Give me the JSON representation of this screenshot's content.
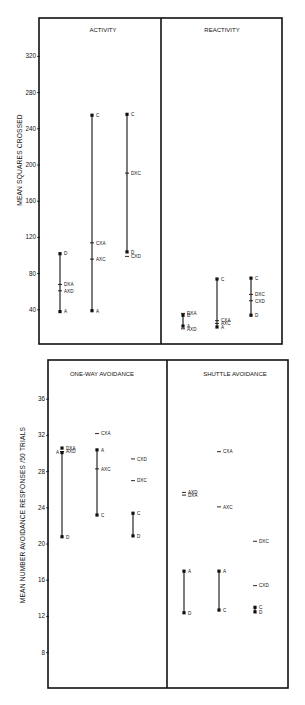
{
  "chart_data": [
    {
      "type": "scatter",
      "subtype": "vertical-range-plot",
      "ylabel": "MEAN   SQUARES   CROSSED",
      "yticks": [
        40,
        80,
        120,
        160,
        200,
        240,
        280,
        320
      ],
      "ylim": [
        0,
        340
      ],
      "grid": false,
      "panels": [
        {
          "title": "ACTIVITY",
          "columns": [
            {
              "line": [
                "A",
                "D"
              ],
              "points": [
                {
                  "label": "D",
                  "value": 102,
                  "marker": "dot"
                },
                {
                  "label": "DXA",
                  "value": 68,
                  "marker": "tick"
                },
                {
                  "label": "AXD",
                  "value": 61,
                  "marker": "tick"
                },
                {
                  "label": "A",
                  "value": 38,
                  "marker": "dot"
                }
              ]
            },
            {
              "line": [
                "A",
                "C"
              ],
              "points": [
                {
                  "label": "C",
                  "value": 255,
                  "marker": "dot"
                },
                {
                  "label": "CXA",
                  "value": 114,
                  "marker": "tick"
                },
                {
                  "label": "AXC",
                  "value": 96,
                  "marker": "tick"
                },
                {
                  "label": "A",
                  "value": 39,
                  "marker": "dot"
                }
              ]
            },
            {
              "line": [
                "D",
                "C"
              ],
              "points": [
                {
                  "label": "C",
                  "value": 256,
                  "marker": "dot"
                },
                {
                  "label": "DXC",
                  "value": 191,
                  "marker": "tick"
                },
                {
                  "label": "D",
                  "value": 104,
                  "marker": "dot"
                },
                {
                  "label": "CXD",
                  "value": 99,
                  "marker": "tick"
                }
              ]
            }
          ]
        },
        {
          "title": "REACTIVITY",
          "columns": [
            {
              "line": [
                "A",
                "D"
              ],
              "points": [
                {
                  "label": "DXA",
                  "value": 36,
                  "marker": "tick"
                },
                {
                  "label": "D",
                  "value": 34,
                  "marker": "dot"
                },
                {
                  "label": "A",
                  "value": 22,
                  "marker": "dot"
                },
                {
                  "label": "AXD",
                  "value": 19,
                  "marker": "tick"
                }
              ]
            },
            {
              "line": [
                "A",
                "C"
              ],
              "points": [
                {
                  "label": "C",
                  "value": 74,
                  "marker": "dot"
                },
                {
                  "label": "CXA",
                  "value": 28,
                  "marker": "tick"
                },
                {
                  "label": "AXC",
                  "value": 25,
                  "marker": "tick"
                },
                {
                  "label": "A",
                  "value": 21,
                  "marker": "dot"
                }
              ]
            },
            {
              "line": [
                "D",
                "C"
              ],
              "points": [
                {
                  "label": "C",
                  "value": 75,
                  "marker": "dot"
                },
                {
                  "label": "DXC",
                  "value": 57,
                  "marker": "tick"
                },
                {
                  "label": "CXD",
                  "value": 50,
                  "marker": "tick"
                },
                {
                  "label": "D",
                  "value": 34,
                  "marker": "dot"
                }
              ]
            }
          ]
        }
      ]
    },
    {
      "type": "scatter",
      "subtype": "vertical-range-plot",
      "ylabel": "MEAN   NUMBER   AVOIDANCE   RESPONSES  /50 TRIALS",
      "yticks": [
        8,
        12,
        16,
        20,
        24,
        28,
        32,
        36
      ],
      "ylim": [
        4,
        39
      ],
      "grid": false,
      "panels": [
        {
          "title": "ONE-WAY     AVOIDANCE",
          "columns": [
            {
              "line": [
                "A",
                "D"
              ],
              "points": [
                {
                  "label": "DXA",
                  "value": 30.6,
                  "marker": "dot"
                },
                {
                  "label": "AXD",
                  "value": 30.2,
                  "marker": "tick"
                },
                {
                  "label": "A",
                  "value": 30.1,
                  "marker": "dot",
                  "label_side": "left"
                },
                {
                  "label": "D",
                  "value": 20.8,
                  "marker": "dot"
                }
              ]
            },
            {
              "line": [
                "A",
                "C"
              ],
              "points": [
                {
                  "label": "CXA",
                  "value": 32.2,
                  "marker": "tick"
                },
                {
                  "label": "A",
                  "value": 30.4,
                  "marker": "dot"
                },
                {
                  "label": "AXC",
                  "value": 28.3,
                  "marker": "tick"
                },
                {
                  "label": "C",
                  "value": 23.2,
                  "marker": "dot"
                }
              ]
            },
            {
              "line": [
                "D",
                "C"
              ],
              "points": [
                {
                  "label": "CXD",
                  "value": 29.4,
                  "marker": "tick"
                },
                {
                  "label": "DXC",
                  "value": 27.0,
                  "marker": "tick"
                },
                {
                  "label": "C",
                  "value": 23.4,
                  "marker": "dot"
                },
                {
                  "label": "D",
                  "value": 20.9,
                  "marker": "dot"
                }
              ]
            }
          ]
        },
        {
          "title": "SHUTTLE     AVOIDANCE",
          "columns": [
            {
              "line": [
                "A",
                "D"
              ],
              "points": [
                {
                  "label": "AXD",
                  "value": 25.7,
                  "marker": "tick"
                },
                {
                  "label": "DXA",
                  "value": 25.4,
                  "marker": "tick"
                },
                {
                  "label": "A",
                  "value": 17.0,
                  "marker": "dot"
                },
                {
                  "label": "D",
                  "value": 12.4,
                  "marker": "dot"
                }
              ]
            },
            {
              "line": [
                "A",
                "C"
              ],
              "points": [
                {
                  "label": "CXA",
                  "value": 30.2,
                  "marker": "tick"
                },
                {
                  "label": "AXC",
                  "value": 24.1,
                  "marker": "tick"
                },
                {
                  "label": "A",
                  "value": 17.0,
                  "marker": "dot"
                },
                {
                  "label": "C",
                  "value": 12.7,
                  "marker": "dot"
                }
              ]
            },
            {
              "line": [
                "D",
                "C"
              ],
              "points": [
                {
                  "label": "DXC",
                  "value": 20.3,
                  "marker": "tick"
                },
                {
                  "label": "CXD",
                  "value": 15.4,
                  "marker": "tick"
                },
                {
                  "label": "C",
                  "value": 13.0,
                  "marker": "dot"
                },
                {
                  "label": "D",
                  "value": 12.5,
                  "marker": "dot"
                }
              ]
            }
          ]
        }
      ]
    }
  ],
  "colors": {
    "ink": "#111111",
    "background": "#ffffff"
  }
}
